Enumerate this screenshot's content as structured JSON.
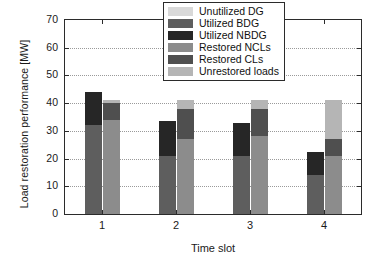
{
  "chart_data": {
    "type": "bar",
    "title": "",
    "xlabel": "Time slot",
    "ylabel": "Load restoration performance [MW]",
    "categories": [
      "1",
      "2",
      "3",
      "4"
    ],
    "ylim": [
      0,
      70
    ],
    "yticks": [
      0,
      10,
      20,
      30,
      40,
      50,
      60,
      70
    ],
    "grid": true,
    "grouping": "two stacked bars per time slot: generation (left) and load (right)",
    "legend": {
      "position": "top-right inside axes",
      "entries": [
        {
          "label": "Unutilized DG",
          "color": "#d9d9d9"
        },
        {
          "label": "Utilized BDG",
          "color": "#5e5e5e"
        },
        {
          "label": "Utilized NBDG",
          "color": "#262626"
        },
        {
          "label": "Restored NCLs",
          "color": "#8c8c8c"
        },
        {
          "label": "Restored CLs",
          "color": "#4f4f4f"
        },
        {
          "label": "Unrestored loads",
          "color": "#b5b5b5"
        }
      ]
    },
    "series": [
      {
        "name": "Unutilized DG",
        "bar": "left",
        "color": "#d9d9d9",
        "values": [
          0,
          0,
          0,
          0
        ]
      },
      {
        "name": "Utilized BDG",
        "bar": "left",
        "color": "#5e5e5e",
        "values": [
          32,
          21,
          21,
          14
        ]
      },
      {
        "name": "Utilized NBDG",
        "bar": "left",
        "color": "#262626",
        "values": [
          12,
          12.5,
          12,
          8.5
        ]
      },
      {
        "name": "Restored NCLs",
        "bar": "right",
        "color": "#8c8c8c",
        "values": [
          34,
          27,
          28,
          21
        ]
      },
      {
        "name": "Restored CLs",
        "bar": "right",
        "color": "#4f4f4f",
        "values": [
          6,
          11,
          10,
          6
        ]
      },
      {
        "name": "Unrestored loads",
        "bar": "right",
        "color": "#b5b5b5",
        "values": [
          1,
          3,
          3,
          14
        ]
      }
    ],
    "bar_totals": {
      "left": [
        44,
        33.5,
        33,
        22.5
      ],
      "right": [
        41,
        41,
        41,
        41
      ]
    }
  },
  "axis": {
    "y_tick_labels": [
      "0",
      "10",
      "20",
      "30",
      "40",
      "50",
      "60",
      "70"
    ],
    "x_tick_labels": [
      "1",
      "2",
      "3",
      "4"
    ]
  }
}
